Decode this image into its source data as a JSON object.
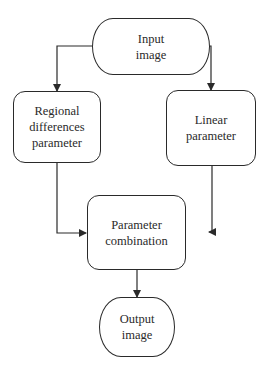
{
  "diagram": {
    "type": "flowchart",
    "nodes": [
      {
        "id": "input",
        "label": "Input\nimage",
        "shape": "terminal"
      },
      {
        "id": "regional",
        "label": "Regional\ndifferences\nparameter",
        "shape": "rounded-rect"
      },
      {
        "id": "linear",
        "label": "Linear\nparameter",
        "shape": "rounded-rect"
      },
      {
        "id": "combination",
        "label": "Parameter\ncombination",
        "shape": "rounded-rect"
      },
      {
        "id": "output",
        "label": "Output\nimage",
        "shape": "terminal"
      }
    ],
    "edges": [
      {
        "from": "input",
        "to": "regional"
      },
      {
        "from": "input",
        "to": "linear"
      },
      {
        "from": "regional",
        "to": "combination"
      },
      {
        "from": "linear",
        "to": "combination"
      },
      {
        "from": "combination",
        "to": "output"
      }
    ],
    "colors": {
      "stroke": "#2a2a2a",
      "background": "#ffffff"
    }
  }
}
